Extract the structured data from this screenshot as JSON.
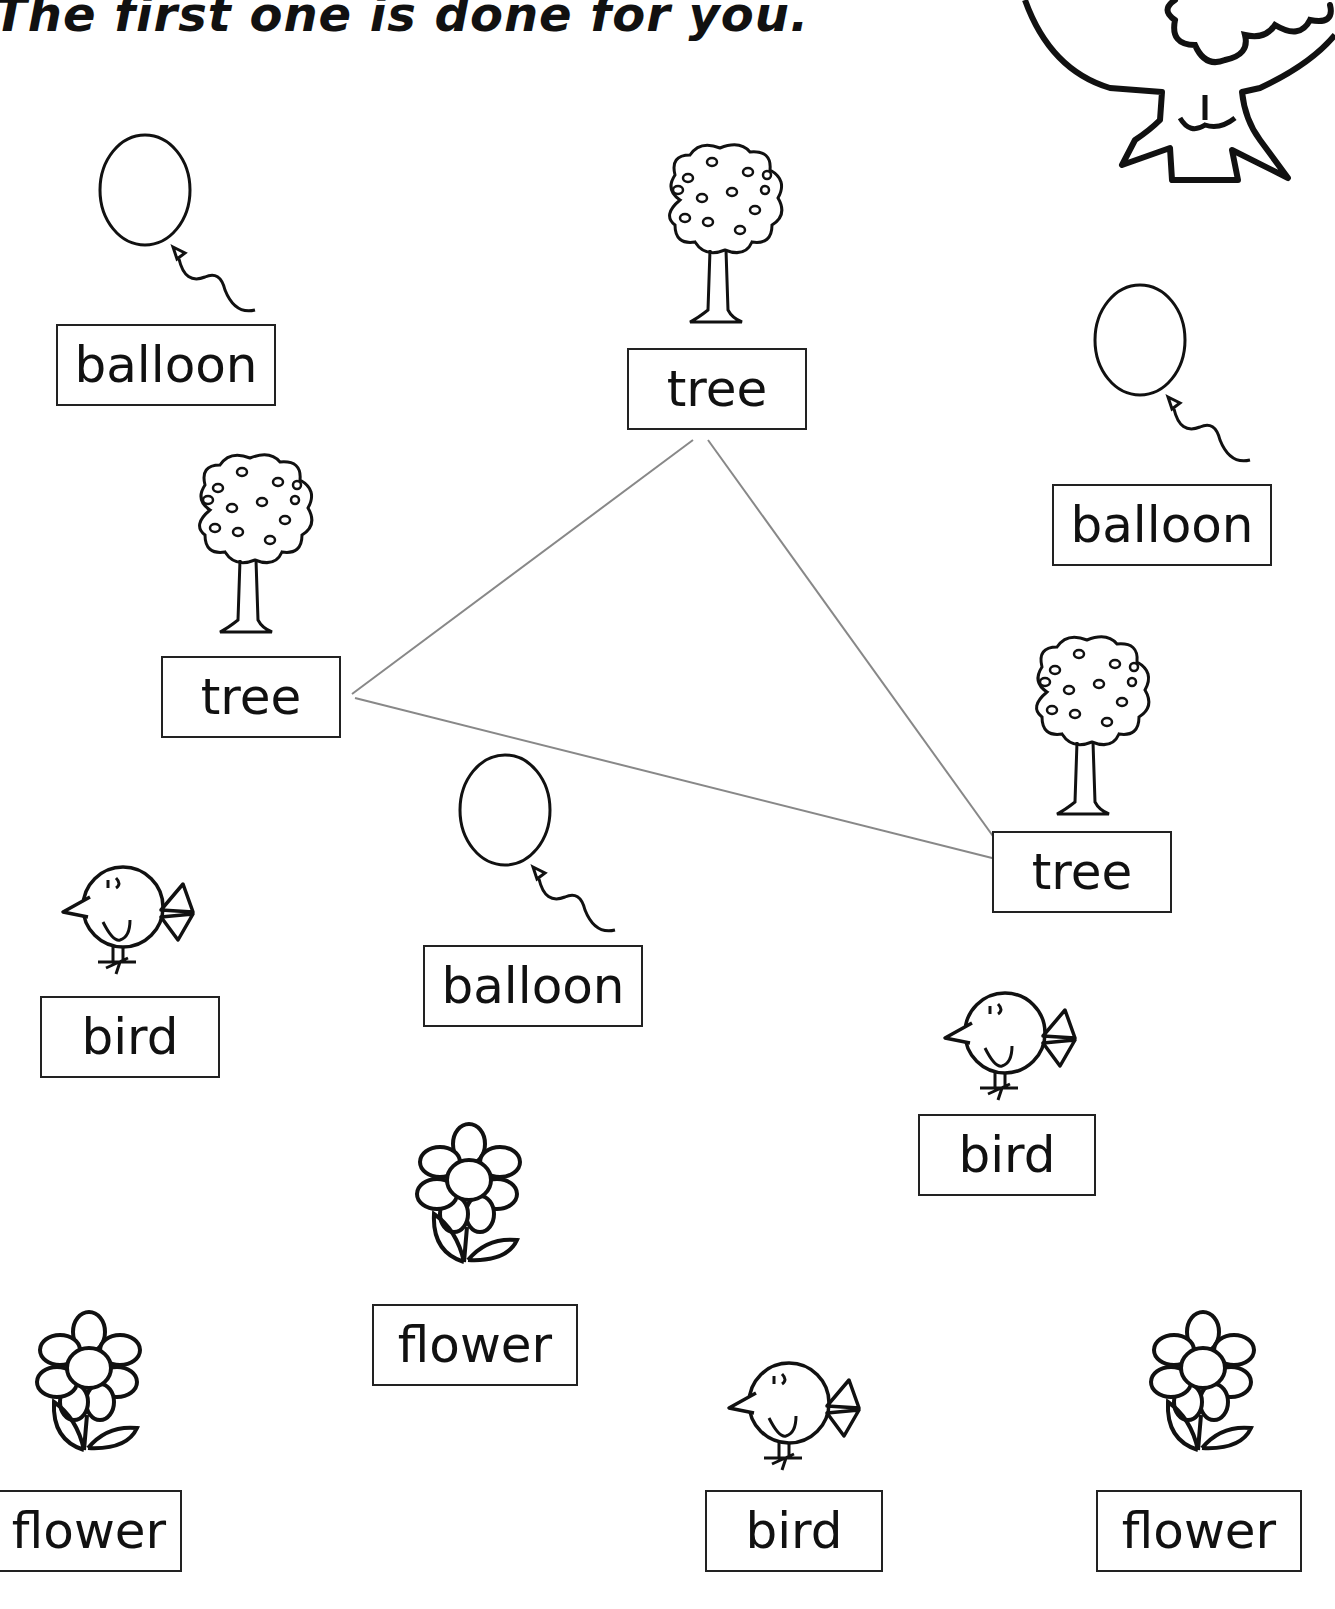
{
  "worksheet": {
    "instruction": "The first one is done for you.",
    "items": [
      {
        "word": "balloon",
        "picture": "balloon-icon"
      },
      {
        "word": "tree",
        "picture": "tree-icon"
      },
      {
        "word": "balloon",
        "picture": "balloon-icon"
      },
      {
        "word": "tree",
        "picture": "tree-icon"
      },
      {
        "word": "tree",
        "picture": "tree-icon"
      },
      {
        "word": "balloon",
        "picture": "balloon-icon"
      },
      {
        "word": "bird",
        "picture": "bird-icon"
      },
      {
        "word": "bird",
        "picture": "bird-icon"
      },
      {
        "word": "flower",
        "picture": "flower-icon"
      },
      {
        "word": "flower",
        "picture": "flower-icon"
      },
      {
        "word": "bird",
        "picture": "bird-icon"
      },
      {
        "word": "flower",
        "picture": "flower-icon"
      }
    ],
    "example_connection": {
      "word": "tree",
      "connected_boxes": [
        "tree (top center)",
        "tree (left)",
        "tree (right)"
      ],
      "line_color": "#888888"
    }
  }
}
